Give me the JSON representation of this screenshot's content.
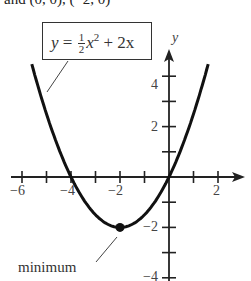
{
  "top_text": "and (0, 0), (−2, 0)",
  "equation": {
    "lhs": "y",
    "equals": "=",
    "frac_num": "1",
    "frac_den": "2",
    "var": "x",
    "exp": "2",
    "rest": "+ 2x"
  },
  "annotation": "minimum",
  "chart_data": {
    "type": "line",
    "title": "",
    "function": "y = (1/2)x^2 + 2x",
    "xlabel": "x",
    "ylabel": "y",
    "xlim": [
      -6.3,
      2.9
    ],
    "ylim": [
      -4,
      5
    ],
    "x_ticks": [
      -6,
      -5,
      -4,
      -3,
      -2,
      -1,
      1,
      2
    ],
    "x_tick_labels": [
      "-6",
      "-4",
      "-2",
      "2"
    ],
    "y_ticks": [
      -4,
      -3,
      -2,
      -1,
      1,
      2,
      3,
      4
    ],
    "y_tick_labels": [
      "-4",
      "-2",
      "2",
      "4"
    ],
    "grid": false,
    "series": [
      {
        "name": "y = 1/2 x^2 + 2x",
        "x": [
          -5.6,
          -5,
          -4,
          -3,
          -2,
          -1,
          0,
          1,
          1.6
        ],
        "y": [
          4.48,
          2.5,
          0,
          -1.5,
          -2,
          -1.5,
          0,
          2.5,
          4.48
        ]
      }
    ],
    "points": [
      {
        "label": "minimum",
        "x": -2,
        "y": -2
      }
    ],
    "annotations": [
      {
        "text": "y = 1/2 x^2 + 2x",
        "points_to": "curve (left branch)"
      },
      {
        "text": "minimum",
        "points_to": [
          -2,
          -2
        ]
      }
    ]
  },
  "tick_labels": {
    "x": [
      "−6",
      "−4",
      "−2",
      "2"
    ],
    "y": [
      "4",
      "2",
      "−2",
      "−4"
    ]
  }
}
